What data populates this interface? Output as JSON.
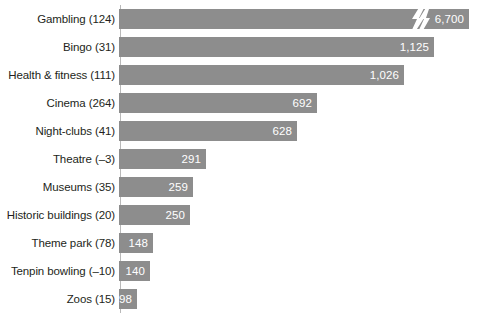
{
  "chart_data": {
    "type": "bar",
    "orientation": "horizontal",
    "title": "",
    "xlabel": "",
    "ylabel": "",
    "grid": false,
    "legend": "none",
    "axis_break": {
      "present": true,
      "applies_to": "Gambling (124)",
      "symbol": "lightning-bolt-break",
      "note": "Gambling bar is truncated; its true value 6,700 exceeds the plotted scale"
    },
    "xlim": [
      0,
      1200
    ],
    "categories": [
      "Gambling (124)",
      "Bingo (31)",
      "Health & fitness (111)",
      "Cinema (264)",
      "Night-clubs (41)",
      "Theatre (–3)",
      "Museums (35)",
      "Historic buildings (20)",
      "Theme park (78)",
      "Tenpin bowling (–10)",
      "Zoos (15)"
    ],
    "values": [
      6700,
      1125,
      1026,
      692,
      628,
      291,
      259,
      250,
      148,
      140,
      98
    ],
    "value_labels": [
      "6,700",
      "1,125",
      "1,026",
      "692",
      "628",
      "291",
      "259",
      "250",
      "148",
      "140",
      "98"
    ],
    "bar_color": "#8d8d8d",
    "value_label_color": "#ffffff",
    "category_label_color": "#231f20",
    "background_color": "#ffffff",
    "bars": [
      {
        "category": "Gambling (124)",
        "value": 6700,
        "label": "6,700",
        "width_px": 350,
        "broken": true
      },
      {
        "category": "Bingo (31)",
        "value": 1125,
        "label": "1,125",
        "width_px": 315,
        "broken": false
      },
      {
        "category": "Health & fitness (111)",
        "value": 1026,
        "label": "1,026",
        "width_px": 285,
        "broken": false
      },
      {
        "category": "Cinema (264)",
        "value": 692,
        "label": "692",
        "width_px": 198,
        "broken": false
      },
      {
        "category": "Night-clubs (41)",
        "value": 628,
        "label": "628",
        "width_px": 178,
        "broken": false
      },
      {
        "category": "Theatre (–3)",
        "value": 291,
        "label": "291",
        "width_px": 87,
        "broken": false
      },
      {
        "category": "Museums (35)",
        "value": 259,
        "label": "259",
        "width_px": 74,
        "broken": false
      },
      {
        "category": "Historic buildings (20)",
        "value": 250,
        "label": "250",
        "width_px": 71,
        "broken": false
      },
      {
        "category": "Theme park (78)",
        "value": 148,
        "label": "148",
        "width_px": 34,
        "broken": false
      },
      {
        "category": "Tenpin bowling (–10)",
        "value": 140,
        "label": "140",
        "width_px": 31,
        "broken": false
      },
      {
        "category": "Zoos (15)",
        "value": 98,
        "label": "98",
        "width_px": 18,
        "broken": false
      }
    ]
  }
}
